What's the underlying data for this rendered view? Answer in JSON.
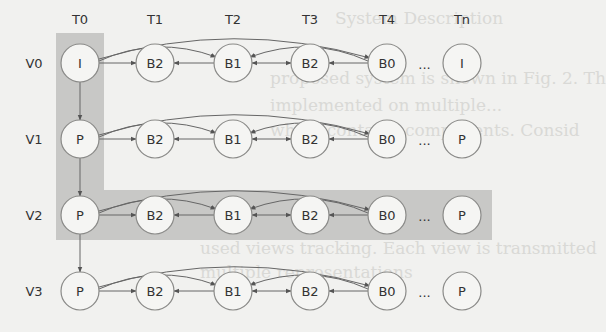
{
  "background_text": [
    {
      "text": "System Description",
      "x": 335,
      "y": 8
    },
    {
      "text": "proposed system is shown in Fig. 2. Th",
      "x": 270,
      "y": 68
    },
    {
      "text": "implemented on multiple...",
      "x": 270,
      "y": 95
    },
    {
      "text": "which contains components. Consid",
      "x": 270,
      "y": 120
    },
    {
      "text": "used views tracking. Each view is transmitted",
      "x": 200,
      "y": 238
    },
    {
      "text": "multiple representations",
      "x": 200,
      "y": 262
    }
  ],
  "diagram": {
    "columns": [
      {
        "label": "T0",
        "x": 80
      },
      {
        "label": "T1",
        "x": 155
      },
      {
        "label": "T2",
        "x": 233
      },
      {
        "label": "T3",
        "x": 310
      },
      {
        "label": "T4",
        "x": 387
      },
      {
        "label": "Tn",
        "x": 462
      }
    ],
    "rows": [
      {
        "label": "V0",
        "y": 63,
        "nodes": [
          "I",
          "B2",
          "B1",
          "B2",
          "B0",
          "I"
        ]
      },
      {
        "label": "V1",
        "y": 139,
        "nodes": [
          "P",
          "B2",
          "B1",
          "B2",
          "B0",
          "P"
        ]
      },
      {
        "label": "V2",
        "y": 215,
        "nodes": [
          "P",
          "B2",
          "B1",
          "B2",
          "B0",
          "P"
        ]
      },
      {
        "label": "V3",
        "y": 291,
        "nodes": [
          "P",
          "B2",
          "B1",
          "B2",
          "B0",
          "P"
        ]
      }
    ],
    "ellipsis": "...",
    "highlight_color": "#c8c8c6",
    "highlight_regions": [
      {
        "name": "column-T0-highlight",
        "description": "vertical band covering T0 of V0-V2"
      },
      {
        "name": "row-V2-highlight",
        "description": "horizontal band covering V2 row"
      }
    ]
  }
}
